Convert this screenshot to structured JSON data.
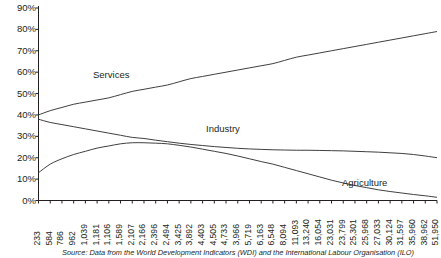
{
  "chart_data": {
    "type": "line",
    "title": "",
    "xlabel": "",
    "ylabel": "",
    "ylim": [
      0,
      90
    ],
    "grid": false,
    "legend_position": "inline-annotations",
    "y_ticks": [
      "0%",
      "10%",
      "20%",
      "30%",
      "40%",
      "50%",
      "60%",
      "70%",
      "80%",
      "90%"
    ],
    "y_tick_values": [
      0,
      10,
      20,
      30,
      40,
      50,
      60,
      70,
      80,
      90
    ],
    "categories": [
      "233",
      "584",
      "786",
      "962",
      "1,039",
      "1,181",
      "1,106",
      "1,589",
      "2,107",
      "2,166",
      "2,396",
      "2,494",
      "3,425",
      "3,892",
      "4,403",
      "4,505",
      "4,733",
      "3,966",
      "5,719",
      "6,163",
      "6,548",
      "8,094",
      "11,093",
      "13,240",
      "16,054",
      "23,031",
      "23,799",
      "25,301",
      "25,968",
      "27,033",
      "30,124",
      "31,597",
      "35,960",
      "38,962",
      "51,950"
    ],
    "series": [
      {
        "name": "Services",
        "color": "#3f3f3f",
        "values": [
          40,
          42,
          43.5,
          45,
          46,
          47,
          48,
          49.5,
          51,
          52,
          53,
          54,
          55.5,
          57,
          58,
          59,
          60,
          61,
          62,
          63,
          64,
          65.5,
          67,
          68,
          69,
          70,
          71,
          72,
          73,
          74,
          75,
          76,
          77,
          78,
          79
        ]
      },
      {
        "name": "Industry",
        "color": "#3f3f3f",
        "values": [
          38,
          36.5,
          35.5,
          34.5,
          33.5,
          32.5,
          31.5,
          30.5,
          29.5,
          29,
          28.2,
          27.5,
          26.8,
          26.2,
          25.7,
          25.2,
          24.8,
          24.4,
          24.1,
          23.9,
          23.7,
          23.6,
          23.5,
          23.5,
          23.4,
          23.3,
          23.2,
          23,
          22.8,
          22.6,
          22.3,
          22,
          21.5,
          20.8,
          20
        ]
      },
      {
        "name": "Agriculture",
        "color": "#3f3f3f",
        "values": [
          13,
          17,
          19.5,
          21.5,
          23,
          24.5,
          25.5,
          26.5,
          27,
          27,
          26.8,
          26.5,
          25.8,
          25,
          24,
          23,
          22,
          20.8,
          19.5,
          18.2,
          17,
          15.5,
          14,
          12.5,
          11,
          9.5,
          8.2,
          7,
          6,
          5,
          4.2,
          3.5,
          2.8,
          2.2,
          1.5
        ]
      }
    ],
    "annotations": [
      {
        "text": "Services",
        "x_px": 93,
        "y_px": 70
      },
      {
        "text": "Industry",
        "x_px": 206,
        "y_px": 124
      },
      {
        "text": "Agriculture",
        "x_px": 342,
        "y_px": 178
      }
    ],
    "source_note": "Source: Data from the World Development Indicators (WDI) and the International Labour Organisation (ILO)"
  }
}
